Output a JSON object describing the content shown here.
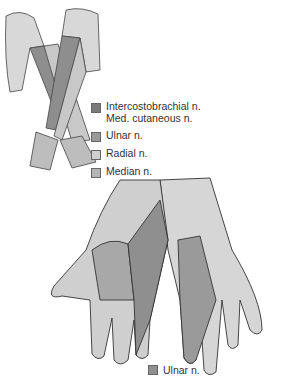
{
  "figure": {
    "legend_top": [
      {
        "label_lines": [
          "Intercostobrachial n.",
          "Med. cutaneous n."
        ],
        "color": "#7a7a7a"
      },
      {
        "label_lines": [
          "Ulnar n."
        ],
        "color": "#999999"
      },
      {
        "label_lines": [
          "Radial n."
        ],
        "color": "#cfcfcf"
      },
      {
        "label_lines": [
          "Median n."
        ],
        "color": "#b5b5b5"
      }
    ],
    "legend_bottom": {
      "label": "Ulnar n.",
      "color": "#8f8f8f"
    }
  }
}
